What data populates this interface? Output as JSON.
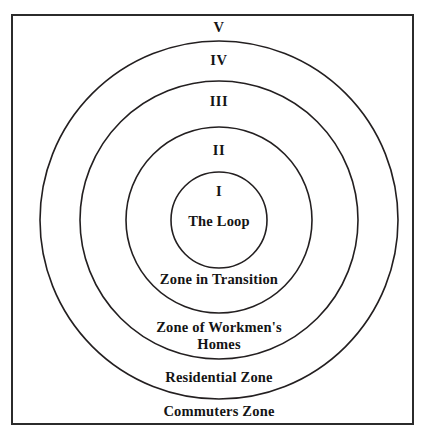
{
  "diagram": {
    "type": "concentric-zone-model",
    "frame": {
      "border_color": "#2b2b2b"
    },
    "circle_stroke_color": "#231f20",
    "background_color": "#ffffff",
    "text_color": "#141414",
    "center": {
      "x": 219,
      "y": 220
    },
    "radii": [
      48,
      93,
      139,
      179
    ],
    "numerals": {
      "i": "I",
      "ii": "II",
      "iii": "III",
      "iv": "IV",
      "v": "V"
    },
    "zones": [
      {
        "numeral": "I",
        "name": "The Loop",
        "radius": 48
      },
      {
        "numeral": "II",
        "name": "Zone in Transition",
        "radius": 93
      },
      {
        "numeral": "III",
        "name": "Zone of Workmen's\nHomes",
        "radius": 139
      },
      {
        "numeral": "IV",
        "name": "Residential Zone",
        "radius": 179
      },
      {
        "numeral": "V",
        "name": "Commuters Zone",
        "radius": null
      }
    ],
    "labels": {
      "loop": "The Loop",
      "transition": "Zone in Transition",
      "workmen": "Zone of Workmen's\nHomes",
      "residential": "Residential Zone",
      "commuters": "Commuters Zone"
    }
  }
}
